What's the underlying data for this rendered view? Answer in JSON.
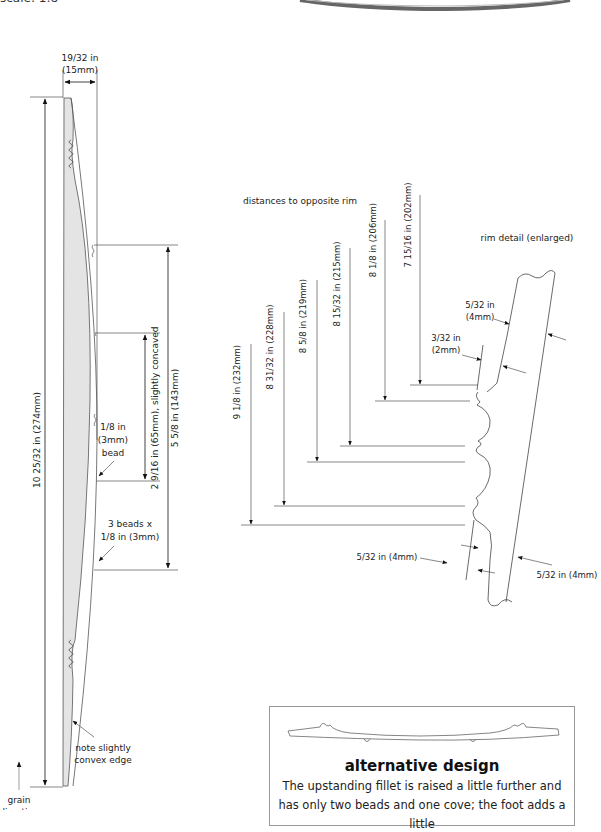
{
  "header": {
    "scale_text": "scale: 1:8"
  },
  "side_profile": {
    "thickness_label_line1": "19/32 in",
    "thickness_label_line2": "(15mm)",
    "overall_length_label": "10 25/32 in (274mm)",
    "fillet_span_label": "5 5/8 in (143mm)",
    "concave_span_label": "2 9/16 in (65mm), slightly concaved",
    "bead_label_line1": "1/8 in",
    "bead_label_line2": "(3mm)",
    "bead_label_line3": "bead",
    "three_beads_line1": "3 beads x",
    "three_beads_line2": "1/8 in (3mm)",
    "convex_note_line1": "note slightly",
    "convex_note_line2": "convex edge",
    "grain_line1": "grain",
    "grain_line2": "direction"
  },
  "rim_distances": {
    "title": "distances to opposite rim",
    "items": [
      {
        "label": "9 1/8 in (232mm)"
      },
      {
        "label": "8 31/32 in (228mm)"
      },
      {
        "label": "8 5/8 in (219mm)"
      },
      {
        "label": "8 15/32 in (215mm)"
      },
      {
        "label": "8 1/8 in (206mm)"
      },
      {
        "label": "7 15/16 in (202mm)"
      }
    ]
  },
  "rim_detail": {
    "title": "rim detail (enlarged)",
    "dim_top_right_line1": "5/32 in",
    "dim_top_right_line2": "(4mm)",
    "dim_top_left_line1": "3/32 in",
    "dim_top_left_line2": "(2mm)",
    "dim_bottom_left": "5/32 in (4mm)",
    "dim_bottom_right": "5/32 in (4mm)"
  },
  "alternative_design": {
    "title": "alternative design",
    "body": "The upstanding fillet is raised a little further and has only two beads and one cove; the foot adds a little"
  }
}
